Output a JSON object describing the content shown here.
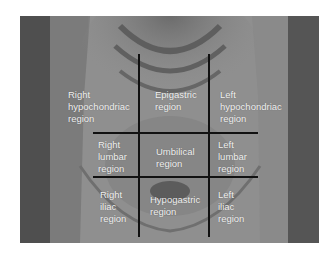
{
  "figure": {
    "type": "anatomical-diagram",
    "regions": [
      {
        "id": "right-hypochondriac",
        "lines": [
          "Right",
          "hypochondriac",
          "region"
        ]
      },
      {
        "id": "epigastric",
        "lines": [
          "Epigastric",
          "region"
        ]
      },
      {
        "id": "left-hypochondriac",
        "lines": [
          "Left",
          "hypochondriac",
          "region"
        ]
      },
      {
        "id": "right-lumbar",
        "lines": [
          "Right",
          "lumbar",
          "region"
        ]
      },
      {
        "id": "umbilical",
        "lines": [
          "Umbilical",
          "region"
        ]
      },
      {
        "id": "left-lumbar",
        "lines": [
          "Left",
          "lumbar",
          "region"
        ]
      },
      {
        "id": "right-iliac",
        "lines": [
          "Right",
          "iliac",
          "region"
        ]
      },
      {
        "id": "hypogastric",
        "lines": [
          "Hypogastric",
          "region"
        ]
      },
      {
        "id": "left-iliac",
        "lines": [
          "Left",
          "iliac",
          "region"
        ]
      }
    ],
    "colors": {
      "label_text": "#f2f2f2",
      "grid_line": "#111111",
      "background": "#ffffff"
    }
  }
}
